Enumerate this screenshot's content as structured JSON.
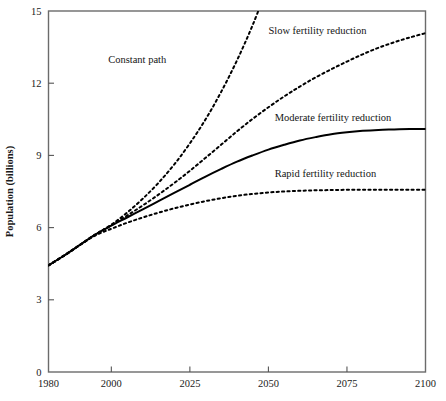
{
  "chart_data": {
    "type": "line",
    "title": "",
    "xlabel": "",
    "ylabel": "Population (billions)",
    "xlim": [
      1980,
      2100
    ],
    "ylim": [
      0,
      15
    ],
    "grid": false,
    "legend_position": "inline-annotations",
    "xticks": [
      1980,
      2000,
      2025,
      2050,
      2075,
      2100
    ],
    "xtick_labels": [
      "1980",
      "2000",
      "2025",
      "2050",
      "2075",
      "2100"
    ],
    "yticks": [
      0,
      3,
      6,
      9,
      12,
      15
    ],
    "ytick_labels": [
      "0",
      "3",
      "6",
      "9",
      "12",
      "15"
    ],
    "x": [
      1980,
      1985,
      1990,
      1995,
      2000,
      2005,
      2010,
      2015,
      2020,
      2025,
      2030,
      2035,
      2040,
      2045,
      2050,
      2055,
      2060,
      2065,
      2070,
      2075,
      2080,
      2085,
      2090,
      2095,
      2100
    ],
    "series": [
      {
        "name": "Constant path",
        "style": "dotted",
        "label": "Constant path",
        "label_x": 1999,
        "label_y": 12.85,
        "values": [
          4.43,
          4.84,
          5.28,
          5.72,
          6.12,
          6.62,
          7.2,
          7.86,
          8.62,
          9.5,
          10.5,
          11.65,
          12.95,
          14.42,
          16.1,
          null,
          null,
          null,
          null,
          null,
          null,
          null,
          null,
          null,
          null
        ]
      },
      {
        "name": "Slow fertility reduction",
        "style": "dotted",
        "label": "Slow fertility reduction",
        "label_x": 2050,
        "label_y": 14.05,
        "values": [
          4.43,
          4.84,
          5.28,
          5.72,
          6.1,
          6.5,
          6.92,
          7.37,
          7.85,
          8.36,
          8.9,
          9.45,
          10.0,
          10.52,
          11.0,
          11.45,
          11.86,
          12.24,
          12.58,
          12.9,
          13.2,
          13.47,
          13.7,
          13.9,
          14.08
        ]
      },
      {
        "name": "Moderate fertility reduction",
        "style": "solid",
        "label": "Moderate fertility reduction",
        "label_x": 2052,
        "label_y": 10.45,
        "values": [
          4.43,
          4.84,
          5.28,
          5.72,
          6.08,
          6.42,
          6.76,
          7.1,
          7.44,
          7.78,
          8.12,
          8.44,
          8.74,
          9.0,
          9.24,
          9.44,
          9.62,
          9.76,
          9.88,
          9.96,
          10.02,
          10.06,
          10.08,
          10.1,
          10.1
        ]
      },
      {
        "name": "Rapid fertility reduction",
        "style": "dotted",
        "label": "Rapid fertility reduction",
        "label_x": 2052,
        "label_y": 8.1,
        "values": [
          4.43,
          4.84,
          5.28,
          5.68,
          5.95,
          6.2,
          6.42,
          6.62,
          6.8,
          6.96,
          7.1,
          7.22,
          7.32,
          7.4,
          7.46,
          7.5,
          7.53,
          7.55,
          7.56,
          7.57,
          7.57,
          7.57,
          7.57,
          7.57,
          7.57
        ]
      }
    ]
  },
  "colors": {
    "line": "#000000",
    "axis": "#555555",
    "frame": "#6b6b6b",
    "text": "#1a1a1a",
    "background": "#ffffff"
  }
}
